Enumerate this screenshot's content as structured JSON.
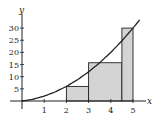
{
  "chart_data": {
    "type": "bar",
    "title": "",
    "xlabel": "x",
    "ylabel": "y",
    "xlim": [
      -0.4,
      5.4
    ],
    "ylim": [
      -3,
      36
    ],
    "grid": false,
    "x_ticks": [
      1,
      2,
      3,
      4,
      5
    ],
    "x_tick_labels": [
      "1",
      "2",
      "3",
      "4",
      "5"
    ],
    "y_ticks": [
      5,
      10,
      15,
      20,
      25,
      30
    ],
    "y_tick_labels": [
      "5",
      "10",
      "15",
      "20",
      "25",
      "30"
    ],
    "curve": {
      "name": "y = x^2 + x",
      "x": [
        0,
        0.5,
        1,
        1.5,
        2,
        2.5,
        3,
        3.5,
        4,
        4.5,
        5,
        5.3
      ],
      "y": [
        0,
        0.75,
        2,
        3.75,
        6,
        8.75,
        12,
        15.75,
        20,
        24.75,
        30,
        33.39
      ]
    },
    "rectangles": [
      {
        "x0": 2,
        "x1": 3,
        "height": 6
      },
      {
        "x0": 3,
        "x1": 4.5,
        "height": 15.75
      },
      {
        "x0": 4.5,
        "x1": 5,
        "height": 30
      }
    ],
    "colors": {
      "rect_fill": "#d4d4d4",
      "stroke": "#222222",
      "background": "#ffffff"
    }
  }
}
